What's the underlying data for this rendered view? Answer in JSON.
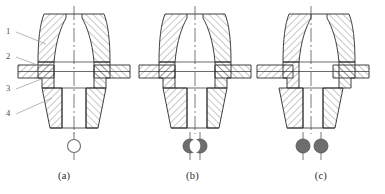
{
  "figure": {
    "kind": "engineering-cross-section-drawing",
    "panel_count": 3,
    "line_color": "#2a2a2a",
    "hatch_color": "#3c3c3c",
    "centerline_color": "#555555",
    "leader_color": "#9a9a9a",
    "symbol_fill_color": "#6e6e6e",
    "symbol_open_color": "#ffffff",
    "background_color": "#ffffff"
  },
  "callouts": [
    {
      "id": "1",
      "label": "1",
      "x": 8,
      "y": 31
    },
    {
      "id": "2",
      "label": "2",
      "x": 8,
      "y": 56
    },
    {
      "id": "3",
      "label": "3",
      "x": 8,
      "y": 88
    },
    {
      "id": "4",
      "label": "4",
      "x": 8,
      "y": 113
    }
  ],
  "panels": [
    {
      "id": "a",
      "caption": "(a)",
      "center_x": 74,
      "symbol": {
        "type": "single-open-circle",
        "name": "concentric-aligned-symbol",
        "circles": [
          {
            "cx": 74,
            "cy": 146,
            "r": 6.5,
            "filled": false
          }
        ]
      }
    },
    {
      "id": "b",
      "caption": "(b)",
      "center_x": 195,
      "symbol": {
        "type": "two-overlapping-filled-circles",
        "name": "partially-offset-symbol",
        "circles": [
          {
            "cx": 190,
            "cy": 146,
            "r": 7,
            "filled": true
          },
          {
            "cx": 200,
            "cy": 146,
            "r": 7,
            "filled": true
          }
        ]
      }
    },
    {
      "id": "c",
      "caption": "(c)",
      "center_x": 311,
      "symbol": {
        "type": "two-separated-filled-circles",
        "name": "fully-offset-symbol",
        "circles": [
          {
            "cx": 303,
            "cy": 146,
            "r": 7,
            "filled": true
          },
          {
            "cx": 321,
            "cy": 146,
            "r": 7,
            "filled": true
          }
        ]
      }
    }
  ],
  "captions": {
    "a": "(a)",
    "b": "(b)",
    "c": "(c)"
  }
}
